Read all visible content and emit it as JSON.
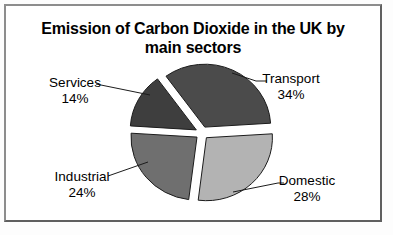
{
  "chart_data": {
    "type": "pie",
    "title": "Emission of Carbon Dioxide in the UK by main sectors",
    "title_lines": [
      "Emission of Carbon Dioxide in the UK by",
      "main sectors"
    ],
    "start_angle_deg": -36,
    "exploded": true,
    "legend": "none",
    "outline_color": "#1c1c1c",
    "slices": [
      {
        "label": "Transport",
        "value": 34,
        "pct_label": "34%",
        "color": "#4b4b4b"
      },
      {
        "label": "Domestic",
        "value": 28,
        "pct_label": "28%",
        "color": "#b3b3b3"
      },
      {
        "label": "Industrial",
        "value": 24,
        "pct_label": "24%",
        "color": "#6f6f6f"
      },
      {
        "label": "Services",
        "value": 14,
        "pct_label": "14%",
        "color": "#3e3e3e"
      }
    ]
  }
}
